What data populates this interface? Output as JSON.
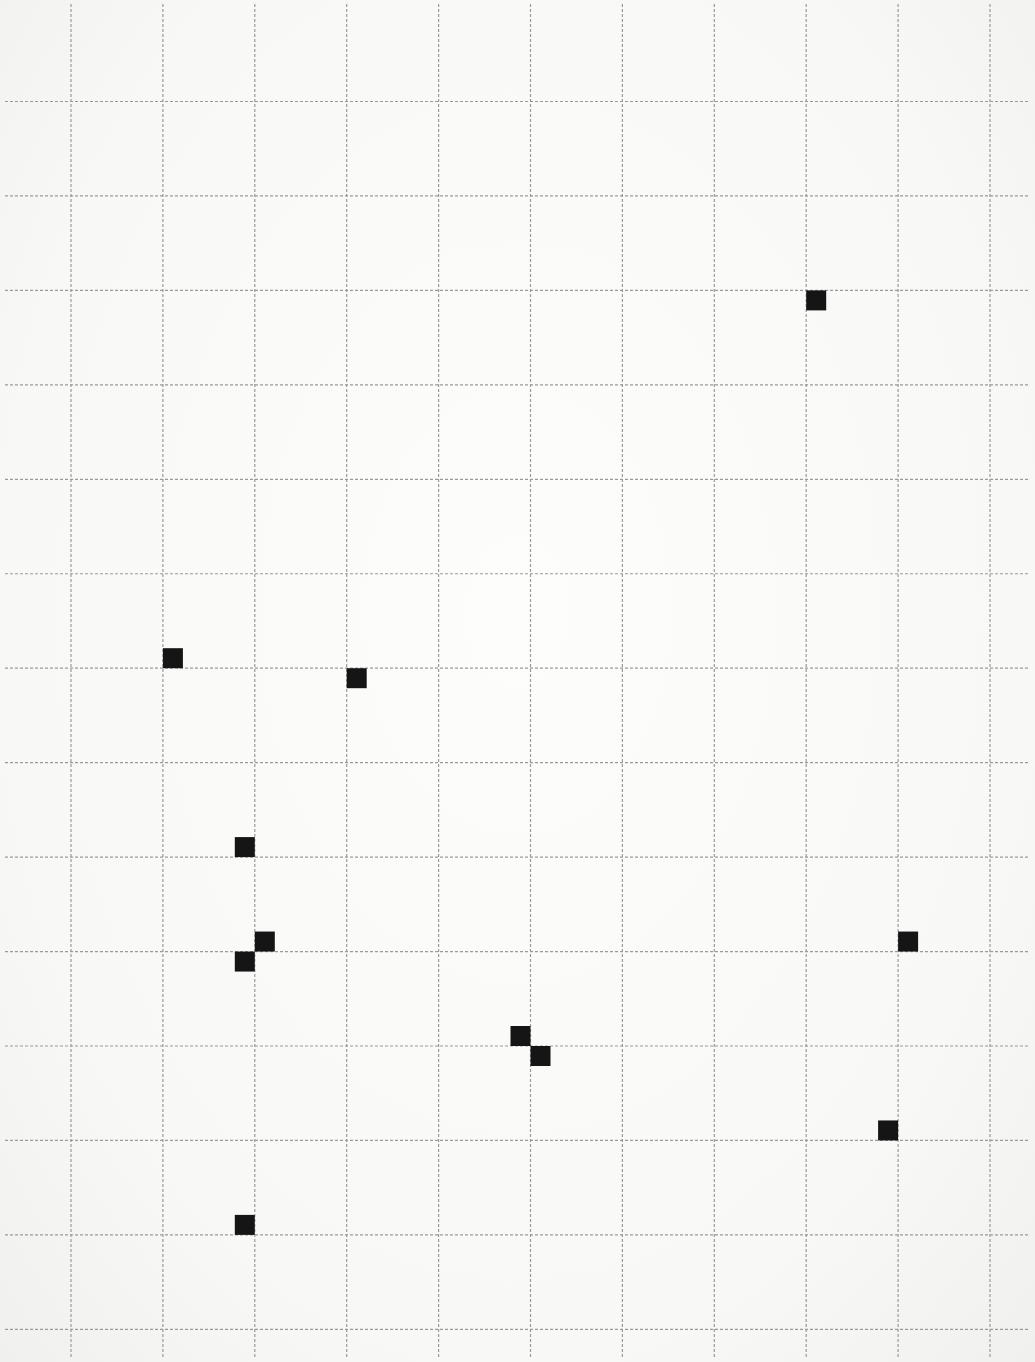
{
  "diagram": {
    "title": "",
    "colors": {
      "paper": "#f9f9f8",
      "grid_line": "#9a9a9a",
      "marker": "#151515"
    },
    "grid": {
      "columns": 11,
      "rows": 14,
      "line_style": "dashed"
    },
    "markers": [
      {
        "id": 1,
        "col": 8,
        "row": 2,
        "quadrant": "below-right"
      },
      {
        "id": 2,
        "col": 1,
        "row": 6,
        "quadrant": "above-right"
      },
      {
        "id": 3,
        "col": 3,
        "row": 6,
        "quadrant": "below-right"
      },
      {
        "id": 4,
        "col": 2,
        "row": 8,
        "quadrant": "above-left"
      },
      {
        "id": 5,
        "col": 2,
        "row": 9,
        "quadrant": "above-right"
      },
      {
        "id": 6,
        "col": 2,
        "row": 9,
        "quadrant": "below-left"
      },
      {
        "id": 7,
        "col": 9,
        "row": 9,
        "quadrant": "above-right"
      },
      {
        "id": 8,
        "col": 5,
        "row": 10,
        "quadrant": "above-left"
      },
      {
        "id": 9,
        "col": 5,
        "row": 10,
        "quadrant": "below-right"
      },
      {
        "id": 10,
        "col": 9,
        "row": 11,
        "quadrant": "above-left"
      },
      {
        "id": 11,
        "col": 2,
        "row": 12,
        "quadrant": "above-left"
      }
    ]
  }
}
